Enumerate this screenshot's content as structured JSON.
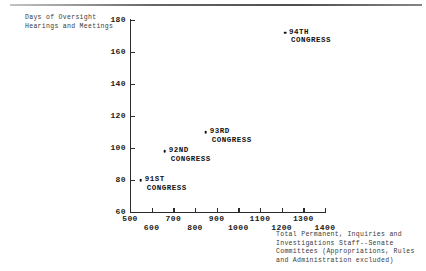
{
  "chart_data": {
    "type": "scatter",
    "title": "",
    "xlabel": "Total Permanent, Inquiries and Investigations Staff--Senate Committees (Appropriations, Rules and Administration excluded)",
    "ylabel": "Days of Oversight Hearings and Meetings",
    "xlim": [
      500,
      1400
    ],
    "ylim": [
      60,
      180
    ],
    "xticks": [
      500,
      600,
      700,
      800,
      900,
      1000,
      1100,
      1200,
      1300,
      1400
    ],
    "xticklabels": [
      "500",
      "600",
      "700",
      "800",
      "900",
      "1000",
      "1100",
      "1200",
      "1300",
      "1400"
    ],
    "yticks": [
      60,
      80,
      100,
      120,
      140,
      160,
      180
    ],
    "yticklabels": [
      "60",
      "80",
      "100",
      "120",
      "140",
      "160",
      "180"
    ],
    "grid": false,
    "legend": false,
    "points": [
      {
        "label_line1": "91ST",
        "label_line2": "CONGRESS",
        "x": 550,
        "y": 80
      },
      {
        "label_line1": "92ND",
        "label_line2": "CONGRESS",
        "x": 660,
        "y": 98
      },
      {
        "label_line1": "93RD",
        "label_line2": "CONGRESS",
        "x": 850,
        "y": 110
      },
      {
        "label_line1": "94TH",
        "label_line2": "CONGRESS",
        "x": 1215,
        "y": 172
      }
    ]
  },
  "axis_titles": {
    "y_line1": "Days of Oversight",
    "y_line2": "Hearings and Meetings",
    "x_line1": "Total Permanent, Inquiries and",
    "x_line2": "Investigations Staff--Senate",
    "x_line3": "Committees (Appropriations, Rules",
    "x_line4": "and Administration excluded)"
  },
  "y_ticks": [
    {
      "label": "180"
    },
    {
      "label": "160"
    },
    {
      "label": "140"
    },
    {
      "label": "120"
    },
    {
      "label": "100"
    },
    {
      "label": "80"
    },
    {
      "label": "60"
    }
  ],
  "x_ticks_top": [
    {
      "label": "500"
    },
    {
      "label": "700"
    },
    {
      "label": "900"
    },
    {
      "label": "1100"
    },
    {
      "label": "1300"
    }
  ],
  "x_ticks_bottom": [
    {
      "label": "600"
    },
    {
      "label": "800"
    },
    {
      "label": "1000"
    },
    {
      "label": "1200"
    },
    {
      "label": "1400"
    }
  ],
  "colors": {
    "ink": "#1a1a1a",
    "axis": "#2b2b2b",
    "marker": "#111111",
    "caption": "#3a3a3a"
  }
}
